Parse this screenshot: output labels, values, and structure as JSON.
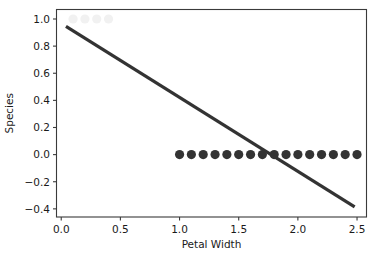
{
  "chart_data": {
    "type": "scatter",
    "title": "",
    "xlabel": "Petal Width",
    "ylabel": "Species",
    "xlim": [
      -0.04,
      2.58
    ],
    "ylim": [
      -0.46,
      1.07
    ],
    "grid": false,
    "legend": null,
    "xticks": [
      0.0,
      0.5,
      1.0,
      1.5,
      2.0,
      2.5
    ],
    "xtick_labels": [
      "0.0",
      "0.5",
      "1.0",
      "1.5",
      "2.0",
      "2.5"
    ],
    "yticks": [
      -0.4,
      -0.2,
      0.0,
      0.2,
      0.4,
      0.6,
      0.8,
      1.0
    ],
    "ytick_labels": [
      "−0.4",
      "−0.2",
      "0.0",
      "0.2",
      "0.4",
      "0.6",
      "0.8",
      "1.0"
    ],
    "series": [
      {
        "name": "class-1-points",
        "type": "scatter",
        "marker": "circle",
        "color": "#f1f1f1",
        "size": 4.6,
        "x": [
          0.1,
          0.2,
          0.3,
          0.4
        ],
        "y": [
          1.0,
          1.0,
          1.0,
          1.0
        ]
      },
      {
        "name": "class-0-points",
        "type": "scatter",
        "marker": "circle",
        "color": "#333333",
        "size": 4.6,
        "x": [
          1.0,
          1.1,
          1.2,
          1.3,
          1.4,
          1.5,
          1.6,
          1.7,
          1.8,
          1.9,
          2.0,
          2.1,
          2.2,
          2.3,
          2.4,
          2.5
        ],
        "y": [
          0.0,
          0.0,
          0.0,
          0.0,
          0.0,
          0.0,
          0.0,
          0.0,
          0.0,
          0.0,
          0.0,
          0.0,
          0.0,
          0.0,
          0.0,
          0.0
        ]
      },
      {
        "name": "regression-line",
        "type": "line",
        "color": "#333333",
        "width": 3.2,
        "x": [
          0.04,
          2.48
        ],
        "y": [
          0.945,
          -0.385
        ]
      }
    ]
  },
  "axes": {
    "x_axis_title": "Petal Width",
    "y_axis_title": "Species"
  }
}
